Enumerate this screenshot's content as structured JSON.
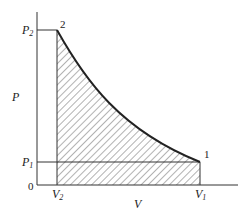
{
  "diagram": {
    "type": "pv-diagram",
    "axes": {
      "y_label": "P",
      "x_label": "V",
      "origin": "0"
    },
    "points": [
      {
        "id": "1",
        "label": "1"
      },
      {
        "id": "2",
        "label": "2"
      }
    ],
    "ticks": {
      "p2": {
        "main": "P",
        "sub": "2"
      },
      "p1": {
        "main": "P",
        "sub": "1"
      },
      "v2": {
        "main": "V",
        "sub": "2"
      },
      "v1": {
        "main": "V",
        "sub": "1"
      }
    },
    "shaded_region": "area under curve 2-1 from V2 to V1 (hatched)"
  }
}
